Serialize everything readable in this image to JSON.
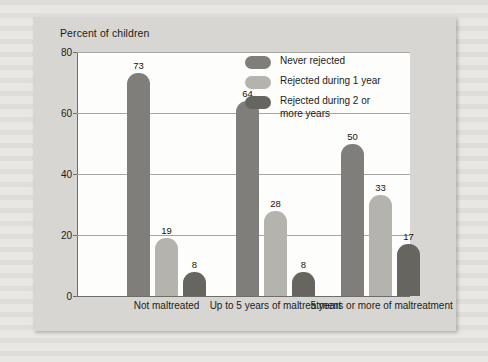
{
  "chart_data": {
    "type": "bar",
    "title": "Percent of children",
    "xlabel": "",
    "ylabel": "Percent of children",
    "ylim": [
      0,
      80
    ],
    "yticks": [
      0,
      20,
      40,
      60,
      80
    ],
    "grid": true,
    "legend_position": "top-right-inside",
    "categories": [
      "Not maltreated",
      "Up to 5 years\nof maltreatment",
      "5 years or more\nof maltreatment"
    ],
    "series": [
      {
        "name": "Never rejected",
        "values": [
          73,
          64,
          50
        ],
        "color": "#7f7e7a"
      },
      {
        "name": "Rejected during 1 year",
        "values": [
          19,
          28,
          33
        ],
        "color": "#b4b3ae"
      },
      {
        "name": "Rejected during 2 or\nmore years",
        "values": [
          8,
          8,
          17
        ],
        "color": "#66655f"
      }
    ]
  },
  "panel": {
    "background_color": "#d7d6d2",
    "plot_background_color": "#fdfdfc",
    "axis_color": "#6f6d69",
    "grid_color": "#a9a7a2"
  },
  "y_tick_labels": [
    "0",
    "20",
    "40",
    "60",
    "80"
  ],
  "legend": {
    "items": [
      {
        "label": "Never rejected"
      },
      {
        "label": "Rejected during 1 year"
      },
      {
        "label": "Rejected during 2 or\nmore years"
      }
    ]
  },
  "bar_values": {
    "g0s0": "73",
    "g0s1": "19",
    "g0s2": "8",
    "g1s0": "64",
    "g1s1": "28",
    "g1s2": "8",
    "g2s0": "50",
    "g2s1": "33",
    "g2s2": "17"
  },
  "category_labels": {
    "c0": "Not maltreated",
    "c1": "Up to 5 years\nof maltreatment",
    "c2": "5 years or more\nof maltreatment"
  }
}
